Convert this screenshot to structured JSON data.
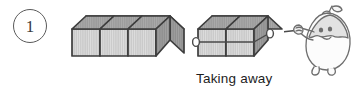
{
  "page": {
    "width": 363,
    "height": 96,
    "background_color": "#ffffff",
    "kind": "math-worksheet-illustration"
  },
  "item": {
    "number": "1",
    "marker_shape": "circle"
  },
  "illustration": {
    "caption": "Taking away",
    "groups": [
      {
        "name": "cube-group-left",
        "cube_count": 3,
        "state": "stationary",
        "roped": false
      },
      {
        "name": "cube-group-right",
        "cube_count": 2,
        "state": "being-pulled-away",
        "roped": true
      }
    ],
    "character": {
      "name": "pulling-character",
      "description": "egg-shaped character with leaves pulling a rope",
      "action": "pulling-rope"
    },
    "rope": {
      "name": "pulling-rope",
      "from": "cube-group-right",
      "to": "pulling-character"
    }
  },
  "colors": {
    "outline": "#3d3d3d",
    "cube_top_face": "#9a9a9a",
    "cube_front_face": "#c9c9c9",
    "cube_side_face": "#8c8c8c",
    "hatch_line": "#ffffff",
    "text": "#1d1d1d",
    "item_marker_border": "#5a5a5a",
    "character_line": "#6e6e6e",
    "character_fill": "#fbfbfb"
  }
}
